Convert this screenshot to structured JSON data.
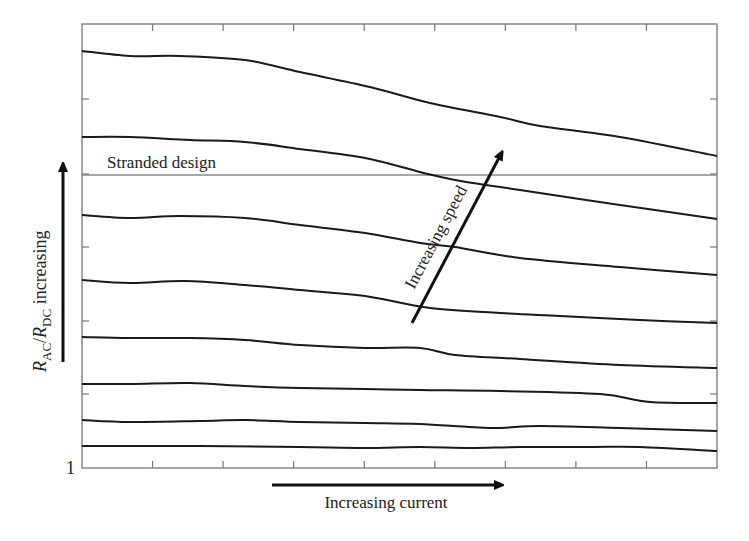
{
  "chart_data": {
    "type": "line",
    "title": "",
    "xlabel": "Increasing current",
    "ylabel": "R_AC/R_DC increasing",
    "ylabel_parts": {
      "r1": "R",
      "s1": "AC",
      "slash": "/",
      "r2": "R",
      "s2": "DC",
      "rest": " increasing"
    },
    "y_origin_tick_label": "1",
    "x_ticks_count": 8,
    "y_ticks": [
      0.25,
      0.5,
      0.75,
      1.0,
      1.25
    ],
    "grid": false,
    "legend": null,
    "annotations": [
      {
        "text": "Stranded design",
        "type": "reference_line_label"
      },
      {
        "text": "Increasing speed",
        "type": "arrow_label"
      }
    ],
    "reference_line": {
      "name": "Stranded design",
      "y": 1.0,
      "color": "#888888"
    },
    "x": [
      0,
      0.68,
      1.39,
      2.31,
      3.09,
      4.0,
      4.82,
      5.82,
      6.77,
      8.12,
      9.0
    ],
    "series": [
      {
        "name": "speed 8 (highest)",
        "pixel_points": [
          [
            82,
            51
          ],
          [
            130,
            56
          ],
          [
            180,
            56
          ],
          [
            245,
            60
          ],
          [
            300,
            72
          ],
          [
            370,
            87
          ],
          [
            430,
            103
          ],
          [
            500,
            117
          ],
          [
            540,
            126
          ],
          [
            620,
            137
          ],
          [
            717,
            156
          ]
        ]
      },
      {
        "name": "speed 7",
        "pixel_points": [
          [
            82,
            137
          ],
          [
            130,
            137
          ],
          [
            190,
            140
          ],
          [
            245,
            142
          ],
          [
            300,
            149
          ],
          [
            365,
            158
          ],
          [
            420,
            172
          ],
          [
            455,
            180
          ],
          [
            520,
            190
          ],
          [
            620,
            205
          ],
          [
            717,
            219
          ]
        ]
      },
      {
        "name": "speed 6",
        "pixel_points": [
          [
            82,
            215
          ],
          [
            130,
            218
          ],
          [
            180,
            216
          ],
          [
            245,
            218
          ],
          [
            300,
            225
          ],
          [
            365,
            233
          ],
          [
            420,
            243
          ],
          [
            455,
            247
          ],
          [
            520,
            258
          ],
          [
            620,
            267
          ],
          [
            717,
            275
          ]
        ]
      },
      {
        "name": "speed 5",
        "pixel_points": [
          [
            82,
            280
          ],
          [
            130,
            283
          ],
          [
            185,
            281
          ],
          [
            245,
            285
          ],
          [
            300,
            290
          ],
          [
            365,
            296
          ],
          [
            430,
            308
          ],
          [
            500,
            313
          ],
          [
            560,
            316
          ],
          [
            640,
            320
          ],
          [
            717,
            323
          ]
        ]
      },
      {
        "name": "speed 4",
        "pixel_points": [
          [
            82,
            337
          ],
          [
            130,
            338
          ],
          [
            190,
            338
          ],
          [
            245,
            340
          ],
          [
            300,
            345
          ],
          [
            365,
            348
          ],
          [
            420,
            348
          ],
          [
            455,
            355
          ],
          [
            520,
            359
          ],
          [
            620,
            365
          ],
          [
            717,
            368
          ]
        ]
      },
      {
        "name": "speed 3",
        "pixel_points": [
          [
            82,
            384
          ],
          [
            130,
            384
          ],
          [
            190,
            383
          ],
          [
            245,
            386
          ],
          [
            300,
            388
          ],
          [
            365,
            389
          ],
          [
            420,
            390
          ],
          [
            500,
            391
          ],
          [
            600,
            394
          ],
          [
            650,
            402
          ],
          [
            717,
            403
          ]
        ]
      },
      {
        "name": "speed 2",
        "pixel_points": [
          [
            82,
            420
          ],
          [
            130,
            422
          ],
          [
            200,
            421
          ],
          [
            245,
            420
          ],
          [
            300,
            422
          ],
          [
            365,
            423
          ],
          [
            420,
            424
          ],
          [
            490,
            428
          ],
          [
            540,
            426
          ],
          [
            620,
            428
          ],
          [
            717,
            431
          ]
        ]
      },
      {
        "name": "speed 1 (lowest)",
        "pixel_points": [
          [
            82,
            446
          ],
          [
            200,
            446
          ],
          [
            300,
            447
          ],
          [
            365,
            448
          ],
          [
            420,
            447
          ],
          [
            470,
            448
          ],
          [
            520,
            447
          ],
          [
            590,
            447
          ],
          [
            640,
            447
          ],
          [
            717,
            451
          ]
        ]
      }
    ],
    "plot_area_px": {
      "left": 82,
      "top": 24,
      "right": 717,
      "bottom": 468
    },
    "colors": {
      "curve": "#1a1a1a",
      "reference": "#8a8a8a",
      "frame": "#777777"
    }
  }
}
